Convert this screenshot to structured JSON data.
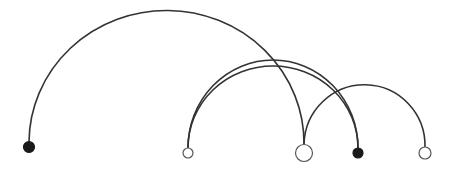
{
  "diagram": {
    "type": "arc-diagram",
    "colors": {
      "edge": "#333333",
      "node_fill_filled": "#1a1a1a",
      "node_fill_open": "#ffffff",
      "node_stroke": "#555555",
      "background": "#ffffff"
    },
    "nodes": [
      {
        "id": "n1",
        "x": 29,
        "y": 147,
        "r": 5.5,
        "filled": true
      },
      {
        "id": "n2",
        "x": 188,
        "y": 153,
        "r": 5,
        "filled": false
      },
      {
        "id": "n3",
        "x": 304,
        "y": 153,
        "r": 8.5,
        "filled": false
      },
      {
        "id": "n4",
        "x": 358,
        "y": 153,
        "r": 5,
        "filled": true
      },
      {
        "id": "n5",
        "x": 425,
        "y": 153,
        "r": 6,
        "filled": false
      }
    ],
    "edges": [
      {
        "from": "n1",
        "to": "n3",
        "peak_y": 12
      },
      {
        "from": "n2",
        "to": "n4",
        "peak_y": 60
      },
      {
        "from": "n2",
        "to": "n4",
        "peak_y": 66
      },
      {
        "from": "n3",
        "to": "n5",
        "peak_y": 86
      }
    ]
  }
}
